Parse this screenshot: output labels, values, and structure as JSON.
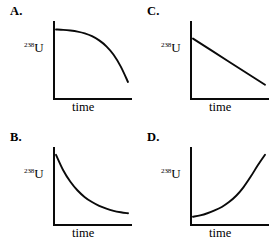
{
  "figure": {
    "background_color": "#ffffff",
    "line_color": "#0a0a0a",
    "panel_count": 4,
    "layout": "2x2 grid"
  },
  "axis_labels": {
    "y_superscript": "238",
    "y_element": "U",
    "y_full": "238U",
    "x": "time"
  },
  "panels": [
    {
      "letter": "A.",
      "position": "top-left",
      "curve_shape": "concave-down decay",
      "description": "Starts high and nearly flat, then drops steeply toward the right"
    },
    {
      "letter": "C.",
      "position": "top-right",
      "curve_shape": "linear decrease",
      "description": "Straight line descending at a constant rate"
    },
    {
      "letter": "B.",
      "position": "bottom-left",
      "curve_shape": "exponential decay",
      "description": "Drops steeply at first then levels off asymptotically"
    },
    {
      "letter": "D.",
      "position": "bottom-right",
      "curve_shape": "exponential growth",
      "description": "Nearly flat at first then rises steeply toward the right"
    }
  ],
  "chart_data": [
    {
      "type": "line",
      "panel": "A",
      "title": "A.",
      "xlabel": "time",
      "ylabel": "238U",
      "grid": false,
      "legend": null,
      "xlim": [
        0,
        1
      ],
      "ylim": [
        0,
        1
      ],
      "x": [
        0.0,
        0.1,
        0.2,
        0.3,
        0.4,
        0.5,
        0.6,
        0.7,
        0.8,
        0.9,
        1.0
      ],
      "y": [
        0.95,
        0.945,
        0.935,
        0.92,
        0.895,
        0.855,
        0.795,
        0.71,
        0.59,
        0.42,
        0.2
      ]
    },
    {
      "type": "line",
      "panel": "C",
      "title": "C.",
      "xlabel": "time",
      "ylabel": "238U",
      "grid": false,
      "legend": null,
      "xlim": [
        0,
        1
      ],
      "ylim": [
        0,
        1
      ],
      "x": [
        0.0,
        0.25,
        0.5,
        0.75,
        1.0
      ],
      "y": [
        0.82,
        0.655,
        0.49,
        0.325,
        0.16
      ]
    },
    {
      "type": "line",
      "panel": "B",
      "title": "B.",
      "xlabel": "time",
      "ylabel": "238U",
      "grid": false,
      "legend": null,
      "xlim": [
        0,
        1
      ],
      "ylim": [
        0,
        1
      ],
      "x": [
        0.0,
        0.1,
        0.2,
        0.3,
        0.4,
        0.5,
        0.6,
        0.7,
        0.8,
        0.9,
        1.0
      ],
      "y": [
        0.96,
        0.74,
        0.575,
        0.45,
        0.355,
        0.285,
        0.23,
        0.19,
        0.16,
        0.14,
        0.125
      ]
    },
    {
      "type": "line",
      "panel": "D",
      "title": "D.",
      "xlabel": "time",
      "ylabel": "238U",
      "grid": false,
      "legend": null,
      "xlim": [
        0,
        1
      ],
      "ylim": [
        0,
        1
      ],
      "x": [
        0.0,
        0.1,
        0.2,
        0.3,
        0.4,
        0.5,
        0.6,
        0.7,
        0.8,
        0.9,
        1.0
      ],
      "y": [
        0.075,
        0.095,
        0.125,
        0.165,
        0.215,
        0.285,
        0.375,
        0.495,
        0.645,
        0.81,
        0.96
      ]
    }
  ]
}
